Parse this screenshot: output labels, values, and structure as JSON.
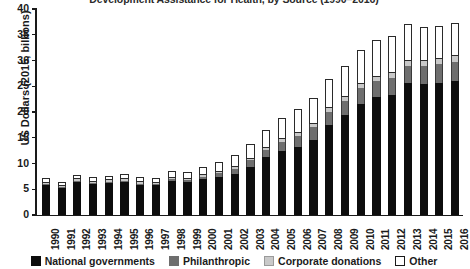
{
  "chart_data": {
    "type": "bar",
    "stacked": true,
    "title": "Development Assistance for Health, by Source (1990–2016)",
    "xlabel": "",
    "ylabel": "US Dollars (2015, billions)",
    "ylim": [
      0,
      40
    ],
    "yticks": [
      0,
      5,
      10,
      15,
      20,
      25,
      30,
      35,
      40
    ],
    "grid": false,
    "legend_position": "bottom",
    "categories": [
      "1990",
      "1991",
      "1992",
      "1993",
      "1994",
      "1995",
      "1996",
      "1997",
      "1998",
      "1999",
      "2000",
      "2001",
      "2002",
      "2003",
      "2004",
      "2005",
      "2006",
      "2007",
      "2008",
      "2009",
      "2010",
      "2011",
      "2012",
      "2013",
      "2014",
      "2015",
      "2016"
    ],
    "series": [
      {
        "name": "National governments",
        "color": "#0d0d0d",
        "values": [
          6.0,
          5.4,
          6.6,
          6.1,
          6.4,
          6.6,
          6.0,
          5.9,
          6.8,
          6.4,
          7.0,
          7.4,
          8.0,
          9.4,
          11.3,
          12.4,
          13.2,
          14.6,
          17.4,
          19.4,
          21.6,
          22.9,
          23.4,
          25.6,
          25.5,
          25.7,
          26.1
        ]
      },
      {
        "name": "Philanthropic",
        "color": "#6e6e6e",
        "values": [
          0.2,
          0.2,
          0.2,
          0.2,
          0.2,
          0.2,
          0.2,
          0.2,
          0.3,
          0.4,
          0.5,
          0.8,
          1.0,
          1.2,
          1.4,
          1.8,
          2.2,
          2.4,
          2.6,
          2.8,
          3.0,
          3.1,
          3.2,
          3.3,
          3.4,
          3.6,
          3.7
        ]
      },
      {
        "name": "Corporate donations",
        "color": "#c9c9c9",
        "values": [
          0.1,
          0.1,
          0.1,
          0.1,
          0.1,
          0.1,
          0.1,
          0.1,
          0.1,
          0.2,
          0.2,
          0.2,
          0.3,
          0.3,
          0.4,
          0.5,
          0.6,
          0.7,
          0.8,
          0.8,
          0.9,
          0.9,
          0.9,
          1.0,
          1.0,
          1.0,
          1.0
        ]
      },
      {
        "name": "Other",
        "color": "#ffffff",
        "values": [
          0.9,
          0.8,
          0.9,
          0.9,
          0.9,
          1.0,
          1.0,
          1.0,
          1.3,
          1.4,
          1.6,
          1.9,
          2.3,
          2.9,
          3.4,
          4.1,
          4.5,
          5.0,
          5.6,
          6.0,
          6.6,
          7.0,
          7.2,
          7.1,
          6.6,
          6.4,
          6.4
        ]
      }
    ],
    "totals": [
      7.2,
      6.5,
      7.8,
      7.3,
      7.6,
      7.9,
      7.3,
      7.2,
      8.5,
      8.4,
      9.3,
      10.3,
      11.6,
      13.8,
      16.5,
      18.8,
      20.5,
      22.7,
      26.4,
      29.0,
      32.1,
      33.9,
      34.7,
      37.0,
      36.5,
      36.7,
      37.2
    ]
  },
  "legend": {
    "items": [
      {
        "label": "National governments",
        "swatch": "national-swatch"
      },
      {
        "label": "Philanthropic",
        "swatch": "philanthropic-swatch"
      },
      {
        "label": "Corporate donations",
        "swatch": "corporate-swatch"
      },
      {
        "label": "Other",
        "swatch": "other-swatch"
      }
    ]
  }
}
